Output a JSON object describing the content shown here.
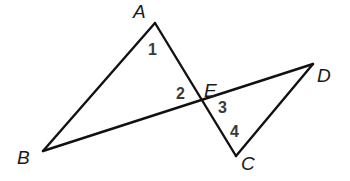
{
  "diagram": {
    "type": "geometry",
    "colors": {
      "line": "#111111",
      "vertex_label": "#1a1a1a",
      "angle_label": "#3a3a3a",
      "background": "#ffffff"
    },
    "points": {
      "A": {
        "x": 155,
        "y": 23
      },
      "B": {
        "x": 43,
        "y": 151
      },
      "C": {
        "x": 236,
        "y": 156
      },
      "D": {
        "x": 313,
        "y": 64
      },
      "E": {
        "x": 202,
        "y": 100
      }
    },
    "segments": [
      {
        "name": "AB",
        "from": "A",
        "to": "B"
      },
      {
        "name": "AC",
        "from": "A",
        "to": "C"
      },
      {
        "name": "BD",
        "from": "B",
        "to": "D"
      },
      {
        "name": "CD",
        "from": "C",
        "to": "D"
      }
    ],
    "vertex_labels": {
      "A": {
        "text": "A",
        "x": 133,
        "y": 18
      },
      "B": {
        "text": "B",
        "x": 17,
        "y": 164
      },
      "C": {
        "text": "C",
        "x": 241,
        "y": 170
      },
      "D": {
        "text": "D",
        "x": 317,
        "y": 82
      },
      "E": {
        "text": "E",
        "x": 204,
        "y": 97
      }
    },
    "angle_labels": [
      {
        "id": "1",
        "text": "1",
        "x": 148,
        "y": 55
      },
      {
        "id": "2",
        "text": "2",
        "x": 176,
        "y": 99
      },
      {
        "id": "3",
        "text": "3",
        "x": 218,
        "y": 113
      },
      {
        "id": "4",
        "text": "4",
        "x": 230,
        "y": 137
      }
    ]
  }
}
